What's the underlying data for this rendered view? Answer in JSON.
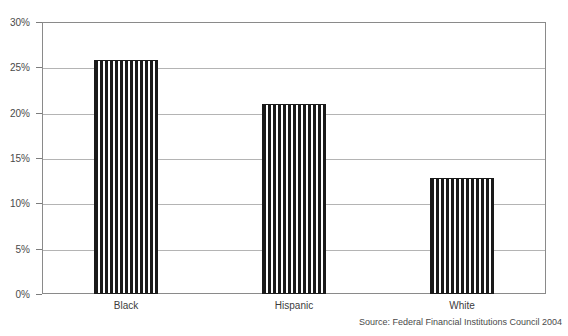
{
  "chart_data": {
    "type": "bar",
    "title": "",
    "categories": [
      "Black",
      "Hispanic",
      "White"
    ],
    "values": [
      25.8,
      21.0,
      12.8
    ],
    "series": [
      {
        "name": "Denial rate",
        "values": [
          25.8,
          21.0,
          12.8
        ]
      }
    ],
    "xlabel": "",
    "ylabel": "",
    "ylim": [
      0,
      30
    ],
    "ytick_values": [
      0,
      5,
      10,
      15,
      20,
      25,
      30
    ],
    "ytick_labels": [
      "0%",
      "5%",
      "10%",
      "15%",
      "20%",
      "25%",
      "30%"
    ],
    "grid": true,
    "legend": false,
    "bar_fill": "vertical-stripe-hatch",
    "bar_color": "#1a1a1a",
    "frame_color": "#8a8a8a",
    "gridline_color": "#b4b4b4"
  },
  "source": {
    "text": "Source: Federal Financial Institutions Council 2004"
  }
}
